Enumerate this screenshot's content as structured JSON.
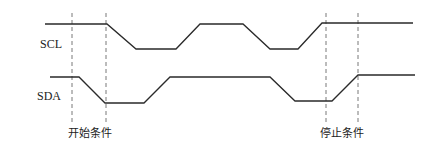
{
  "diagram": {
    "signals": [
      {
        "name": "SCL",
        "label_pos": [
          40,
          37
        ],
        "points": [
          [
            45,
            24
          ],
          [
            107,
            24
          ],
          [
            136,
            49
          ],
          [
            176,
            49
          ],
          [
            200,
            24
          ],
          [
            243,
            24
          ],
          [
            270,
            49
          ],
          [
            298,
            49
          ],
          [
            322,
            23
          ],
          [
            413,
            23
          ]
        ]
      },
      {
        "name": "SDA",
        "label_pos": [
          37,
          89
        ],
        "points": [
          [
            50,
            77
          ],
          [
            79,
            77
          ],
          [
            105,
            103
          ],
          [
            144,
            103
          ],
          [
            170,
            77
          ],
          [
            270,
            77
          ],
          [
            295,
            101
          ],
          [
            332,
            101
          ],
          [
            358,
            75
          ],
          [
            415,
            75
          ]
        ]
      }
    ],
    "markers": [
      {
        "x": 72,
        "y1": 13,
        "y2": 122
      },
      {
        "x": 106,
        "y1": 13,
        "y2": 122
      },
      {
        "x": 326,
        "y1": 13,
        "y2": 122
      },
      {
        "x": 358,
        "y1": 13,
        "y2": 122
      }
    ],
    "captions": [
      {
        "text": "开始条件",
        "x": 90,
        "y": 124
      },
      {
        "text": "停止条件",
        "x": 342,
        "y": 124
      }
    ],
    "colors": {
      "line": "#2a2a2a",
      "dash": "#555555"
    }
  }
}
